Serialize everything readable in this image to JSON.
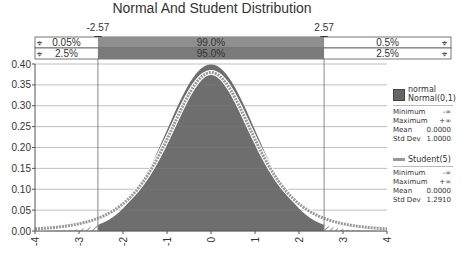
{
  "chart_data": {
    "type": "area",
    "title": "Normal And Student Distribution",
    "xlabel": "",
    "ylabel": "",
    "xlim": [
      -4,
      4
    ],
    "ylim": [
      0,
      0.4
    ],
    "x_ticks": [
      "-4",
      "-3",
      "-2",
      "-1",
      "0",
      "1",
      "2",
      "3",
      "4"
    ],
    "y_ticks": [
      "0.00",
      "0.05",
      "0.10",
      "0.15",
      "0.20",
      "0.25",
      "0.30",
      "0.35",
      "0.40"
    ],
    "grid": true,
    "legend_position": "right",
    "series": [
      {
        "name": "normal",
        "label": "Normal(0,1)",
        "kind": "area",
        "mean": 0,
        "std": 1,
        "color": "#6e6e6e"
      },
      {
        "name": "Student(5)",
        "kind": "line",
        "df": 5,
        "mean": 0,
        "std": 1.291,
        "color": "#9a9a9a"
      }
    ],
    "markers": [
      {
        "label": "-2.57",
        "x": -2.57
      },
      {
        "label": "2.57",
        "x": 2.57
      }
    ],
    "interval_bars": [
      {
        "left": "0.05%",
        "center": "99.0%",
        "right": "0.5%"
      },
      {
        "left": "2.5%",
        "center": "95.0%",
        "right": "2.5%"
      }
    ]
  },
  "legend": {
    "normal": {
      "title": "normal",
      "label": "Normal(0,1)",
      "stats": [
        {
          "k": "Minimum",
          "v": "-∞"
        },
        {
          "k": "Maximum",
          "v": "+∞"
        },
        {
          "k": "Mean",
          "v": "0.0000"
        },
        {
          "k": "Std Dev",
          "v": "1.0000"
        }
      ]
    },
    "student": {
      "label": "Student(5)",
      "stats": [
        {
          "k": "Minimum",
          "v": "-∞"
        },
        {
          "k": "Maximum",
          "v": "+∞"
        },
        {
          "k": "Mean",
          "v": "0.0000"
        },
        {
          "k": "Std Dev",
          "v": "1.2910"
        }
      ]
    }
  }
}
